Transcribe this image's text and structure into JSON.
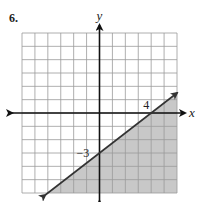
{
  "problem": {
    "number": "6."
  },
  "colors": {
    "grid": "#9a9a9a",
    "shade": "#c8c8c8",
    "axis": "#111111",
    "line": "#333333"
  },
  "chart_data": {
    "type": "line",
    "title": "",
    "xlabel": "x",
    "ylabel": "y",
    "xlim": [
      -6,
      6
    ],
    "ylim": [
      -6,
      6
    ],
    "grid": true,
    "grid_step": 1,
    "series": [
      {
        "name": "boundary",
        "equation": "y = (3/4)x - 3",
        "style": "solid",
        "x": [
          -4.2,
          6
        ],
        "y": [
          -6.15,
          1.5
        ],
        "shaded_region": "below"
      }
    ],
    "annotations": [
      {
        "text": "4",
        "x": 4,
        "y": 0,
        "note": "x-intercept"
      },
      {
        "text": "−3",
        "x": 0,
        "y": -3,
        "note": "y-intercept"
      }
    ]
  },
  "labels": {
    "x_axis": "x",
    "y_axis": "y",
    "x_intercept": "4",
    "y_intercept": "−3"
  }
}
